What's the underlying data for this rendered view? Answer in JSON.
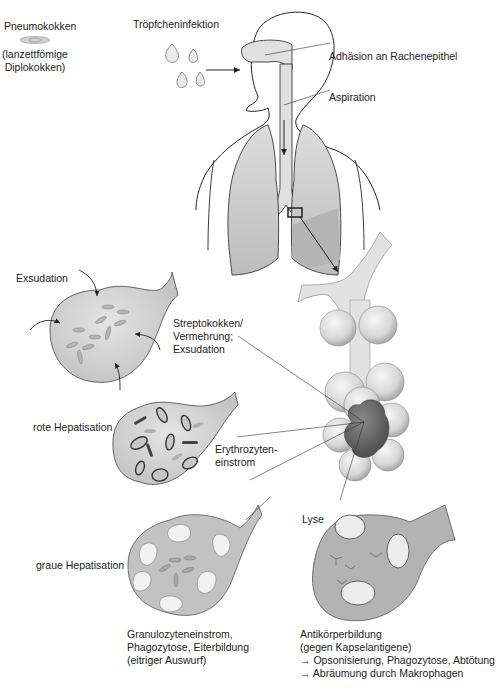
{
  "labels": {
    "pneumokokken": "Pneumokokken",
    "pneumokokken_sub1": "(lanzettfömige",
    "pneumokokken_sub2": "Diplokokken)",
    "troepfchen": "Tröpfcheninfektion",
    "adhaesion": "Adhäsion an Rachenepithel",
    "aspiration": "Aspiration",
    "exsudation": "Exsudation",
    "streptokokken_1": "Streptokokken/",
    "streptokokken_2": "Vermehrung;",
    "streptokokken_3": "Exsudation",
    "rote_hepatisation": "rote Hepatisation",
    "erythrozyten_1": "Erythrozyten-",
    "erythrozyten_2": "einstrom",
    "graue_hepatisation": "graue Hepatisation",
    "lyse": "Lyse",
    "granulozyten_1": "Granulozyteneinstrom,",
    "granulozyten_2": "Phagozytose, Eiterbildung",
    "granulozyten_3": "(eitriger Auswurf)",
    "antikoerper_1": "Antikörperbildung",
    "antikoerper_2": "(gegen Kapselantigene)",
    "antikoerper_3": "→ Opsonisierung, Phagozytose, Abtötung",
    "antikoerper_4": "→ Abräumung durch Makrophagen"
  },
  "colors": {
    "lung_fill": "#c9c9c9",
    "alveolus_fill": "#d8d8d8",
    "bronchus_fill": "#e6e6e6",
    "consolidation": "#6e6e6e",
    "line": "#222222"
  }
}
